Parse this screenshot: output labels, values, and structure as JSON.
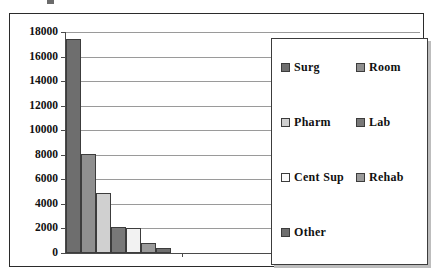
{
  "chart_data": {
    "type": "bar",
    "title": "",
    "xlabel": "",
    "ylabel": "",
    "ylim": [
      0,
      18000
    ],
    "ytick_step": 2000,
    "grid": true,
    "legend_position": "inside-right",
    "categories": [
      "Surg",
      "Room",
      "Pharm",
      "Lab",
      "Cent Sup",
      "Rehab",
      "Other"
    ],
    "values": [
      17400,
      8050,
      4900,
      2150,
      2000,
      850,
      380
    ],
    "series": [
      {
        "name": "Charges",
        "values": [
          17400,
          8050,
          4900,
          2150,
          2000,
          850,
          380
        ]
      }
    ],
    "ytick_labels": [
      "18000",
      "16000",
      "14000",
      "12000",
      "10000",
      "8000",
      "6000",
      "4000",
      "2000",
      "0"
    ],
    "ytick_values": [
      18000,
      16000,
      14000,
      12000,
      10000,
      8000,
      6000,
      4000,
      2000,
      0
    ],
    "xtick_labels": [
      "",
      "",
      ""
    ],
    "bar_colors": [
      "#6e6e6e",
      "#8f8f8f",
      "#d0d0d0",
      "#787878",
      "#f2f2f2",
      "#9a9a9a",
      "#6e6e6e"
    ]
  },
  "legend": {
    "items": [
      {
        "label": "Surg",
        "color": "#6e6e6e"
      },
      {
        "label": "Room",
        "color": "#8f8f8f"
      },
      {
        "label": "Pharm",
        "color": "#d0d0d0"
      },
      {
        "label": "Lab",
        "color": "#787878"
      },
      {
        "label": "Cent Sup",
        "color": "#fbfbfb"
      },
      {
        "label": "Rehab",
        "color": "#9a9a9a"
      },
      {
        "label": "Other",
        "color": "#6e6e6e"
      }
    ]
  },
  "colors": {
    "frame": "#2b2b2b",
    "axis": "#4a4a4a",
    "gridline": "#9a9a9a",
    "plot_background": "#ffffff",
    "text": "#111111"
  }
}
